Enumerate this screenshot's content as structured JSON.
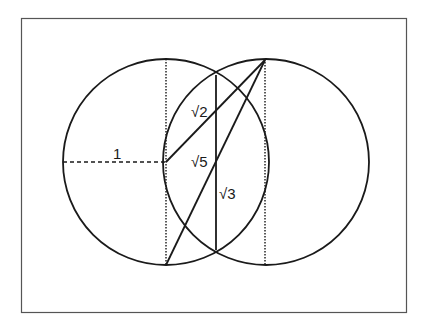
{
  "diagram": {
    "frame": {
      "x": 21,
      "y": 18,
      "width": 386,
      "height": 295,
      "stroke": "#555555"
    },
    "circles": [
      {
        "name": "left-circle",
        "cx": 166,
        "cy": 162,
        "r": 103
      },
      {
        "name": "right-circle",
        "cx": 266,
        "cy": 162,
        "r": 103
      }
    ],
    "labels": {
      "radius": "1",
      "sqrt2": "√2",
      "sqrt5": "√5",
      "sqrt3": "√3"
    },
    "stroke_color": "#1a1a1a"
  }
}
